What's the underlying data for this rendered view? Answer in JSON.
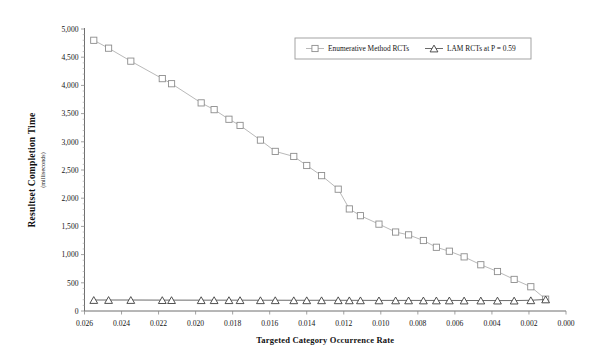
{
  "chart_data": {
    "type": "line",
    "title": "",
    "xlabel": "Targeted Category Occurrence Rate",
    "ylabel": "Resultset Completion Time",
    "ylabel_sub": "(milliseconds)",
    "xlim": [
      0.026,
      0.0
    ],
    "ylim": [
      0,
      5000
    ],
    "x_reversed": true,
    "grid": false,
    "legend_position": "top-right",
    "xticks": [
      "0.026",
      "0.024",
      "0.022",
      "0.020",
      "0.018",
      "0.016",
      "0.014",
      "0.012",
      "0.010",
      "0.008",
      "0.006",
      "0.004",
      "0.002",
      "0.000"
    ],
    "xtick_values": [
      0.026,
      0.024,
      0.022,
      0.02,
      0.018,
      0.016,
      0.014,
      0.012,
      0.01,
      0.008,
      0.006,
      0.004,
      0.002,
      0.0
    ],
    "yticks": [
      "0",
      "500",
      "1,000",
      "1,500",
      "2,000",
      "2,500",
      "3,000",
      "3,500",
      "4,000",
      "4,500",
      "5,000"
    ],
    "ytick_values": [
      0,
      500,
      1000,
      1500,
      2000,
      2500,
      3000,
      3500,
      4000,
      4500,
      5000
    ],
    "y_minor_step": 100,
    "series": [
      {
        "name": "Enumerative Method RCTs",
        "marker": "square",
        "color": "#b9b9b9",
        "x": [
          0.0255,
          0.0247,
          0.0235,
          0.0218,
          0.0213,
          0.0197,
          0.019,
          0.0182,
          0.0176,
          0.0165,
          0.0157,
          0.0147,
          0.014,
          0.0132,
          0.0123,
          0.0117,
          0.0111,
          0.0101,
          0.0092,
          0.0085,
          0.0077,
          0.007,
          0.0063,
          0.0055,
          0.0046,
          0.0037,
          0.0028,
          0.0019,
          0.0011
        ],
        "values": [
          4800,
          4660,
          4430,
          4120,
          4030,
          3690,
          3570,
          3400,
          3290,
          3030,
          2830,
          2740,
          2580,
          2400,
          2160,
          1810,
          1690,
          1540,
          1400,
          1350,
          1250,
          1130,
          1060,
          960,
          820,
          700,
          560,
          430,
          210
        ]
      },
      {
        "name": "LAM RCTs at P = 0.59",
        "marker": "triangle",
        "color": "#6b6b6b",
        "x": [
          0.0255,
          0.0247,
          0.0235,
          0.0218,
          0.0213,
          0.0197,
          0.019,
          0.0182,
          0.0176,
          0.0165,
          0.0157,
          0.0147,
          0.014,
          0.0132,
          0.0123,
          0.0117,
          0.0111,
          0.0101,
          0.0092,
          0.0085,
          0.0077,
          0.007,
          0.0063,
          0.0055,
          0.0046,
          0.0037,
          0.0028,
          0.0019,
          0.0011
        ],
        "values": [
          195,
          195,
          195,
          193,
          193,
          192,
          192,
          192,
          192,
          191,
          191,
          190,
          190,
          190,
          190,
          189,
          189,
          188,
          188,
          188,
          187,
          187,
          187,
          186,
          186,
          185,
          185,
          190,
          205
        ]
      }
    ],
    "legend": [
      {
        "label": "Enumerative Method RCTs",
        "marker": "square"
      },
      {
        "label": "LAM RCTs at P = 0.59",
        "marker": "triangle"
      }
    ]
  }
}
